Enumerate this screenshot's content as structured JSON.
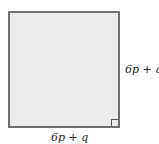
{
  "diagram": {
    "shape": "square",
    "fill_color": "#ececec",
    "stroke_color": "#6f6f6f",
    "right_angle_marker": "bottom-right",
    "labels": {
      "right_side": "6p + q",
      "bottom_side": "6p + q"
    }
  }
}
